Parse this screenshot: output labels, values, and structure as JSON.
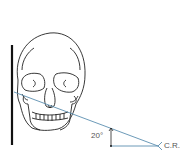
{
  "diagram": {
    "angle_label": "20°",
    "ray_label": "C.R.",
    "colors": {
      "line": "#1a1a1a",
      "ray": "#5b8fb0",
      "text": "#555555"
    }
  }
}
